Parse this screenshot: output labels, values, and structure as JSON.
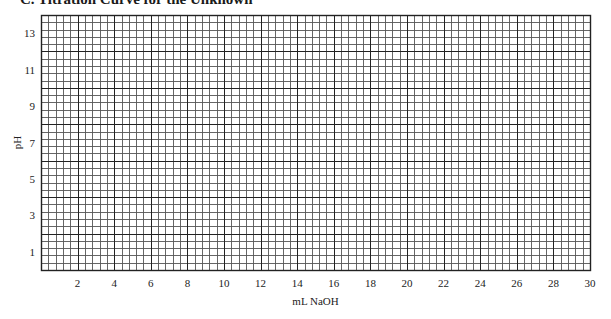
{
  "page": {
    "title": "C.   Titration Curve for the Unknown"
  },
  "chart_data": {
    "type": "line",
    "title": "C. Titration Curve for the Unknown",
    "xlabel": "mL NaOH",
    "ylabel": "pH",
    "xlim": [
      0,
      30
    ],
    "ylim": [
      0,
      14
    ],
    "x_ticks": [
      "2",
      "4",
      "6",
      "8",
      "10",
      "12",
      "14",
      "16",
      "18",
      "20",
      "22",
      "24",
      "26",
      "28",
      "30"
    ],
    "y_ticks": [
      "1",
      "3",
      "5",
      "7",
      "9",
      "11",
      "13"
    ],
    "grid": true,
    "grid_major_step_x": 2,
    "grid_minor_step_x": 0.4,
    "grid_major_step_y": 2,
    "grid_minor_step_y": 0.4,
    "series": [],
    "note": "Blank graph paper; no data plotted"
  },
  "layout": {
    "plot_left": 41,
    "plot_top": 15,
    "plot_right": 590,
    "plot_bottom": 270,
    "grid_color": "#2a2a2a"
  }
}
